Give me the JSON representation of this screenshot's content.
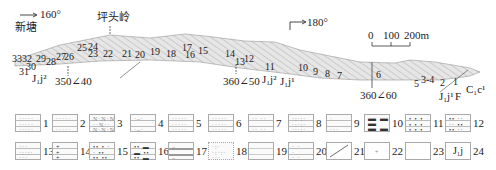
{
  "profile": {
    "direction_left": "160°",
    "direction_right": "180°",
    "place_left": "新塘",
    "peak_name": "坪头岭",
    "scale": {
      "labels": [
        "0",
        "100",
        "200m"
      ]
    },
    "attitudes": [
      "350∠40",
      "360∠50",
      "360∠60"
    ],
    "formation_labels": {
      "j1j2_left": "J₁j²",
      "j1j2_mid": "J₁j²",
      "j1j1_mid": "J₁j¹",
      "j1j1_right": "J₁j¹",
      "fault": "F",
      "c1c1": "C₁c¹"
    },
    "layer_numbers": [
      "33",
      "32",
      "31",
      "30",
      "29",
      "28",
      "27",
      "26",
      "25",
      "24",
      "23",
      "22",
      "21",
      "20",
      "19",
      "18",
      "17",
      "16",
      "15",
      "14",
      "13",
      "12",
      "11",
      "10",
      "9",
      "8",
      "7",
      "6",
      "5",
      "3-4",
      "2",
      "1"
    ]
  },
  "legend": {
    "items": [
      {
        "n": "1"
      },
      {
        "n": "2"
      },
      {
        "n": "3"
      },
      {
        "n": "4"
      },
      {
        "n": "5"
      },
      {
        "n": "6"
      },
      {
        "n": "7"
      },
      {
        "n": "8"
      },
      {
        "n": "9"
      },
      {
        "n": "10"
      },
      {
        "n": "11"
      },
      {
        "n": "12"
      },
      {
        "n": "13"
      },
      {
        "n": "14"
      },
      {
        "n": "15"
      },
      {
        "n": "16"
      },
      {
        "n": "17"
      },
      {
        "n": "18"
      },
      {
        "n": "19"
      },
      {
        "n": "20"
      },
      {
        "n": "21"
      },
      {
        "n": "22"
      },
      {
        "n": "23"
      },
      {
        "n": "24",
        "symbol": "J₁j"
      }
    ]
  }
}
